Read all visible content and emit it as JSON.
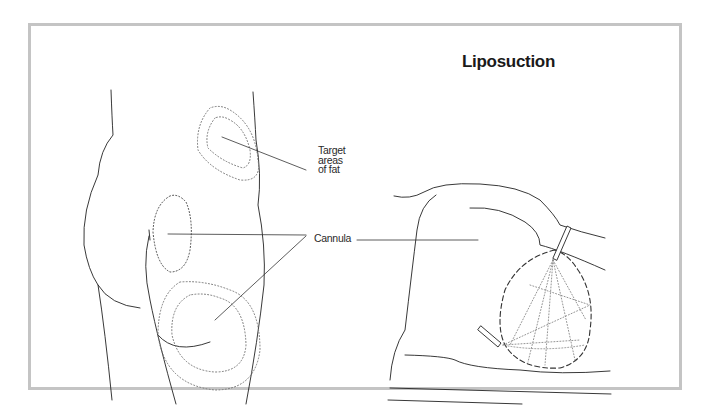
{
  "figure": {
    "title": "Liposuction",
    "labels": {
      "target_line1": "Target",
      "target_line2": "areas",
      "target_line3": "of fat",
      "cannula": "Cannula"
    },
    "colors": {
      "frame_border": "#c4c4c4",
      "line": "#222222",
      "dotted": "#777777"
    },
    "panels": [
      {
        "name": "rear-view-buttocks-thighs",
        "description": "Rear view of hips and thighs with dotted target fat regions"
      },
      {
        "name": "side-view-cannula-insertion",
        "description": "Side view with cannula inserted into dashed fat pocket"
      }
    ]
  }
}
